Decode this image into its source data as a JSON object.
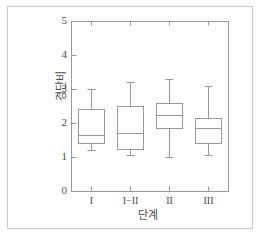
{
  "figure": {
    "background_color": "#ffffff",
    "border_color": "#c9c9c9",
    "line_color": "#999999",
    "text_color": "#4a4a4a"
  },
  "chart_data": {
    "type": "box",
    "title": "",
    "subtitle": "",
    "xlabel": "단계",
    "ylabel": "경단비",
    "categories": [
      "I",
      "I−II",
      "II",
      "III"
    ],
    "xtick_labels": [
      "I",
      "I−II",
      "II",
      "III"
    ],
    "ytick_labels": [
      "0",
      "1",
      "2",
      "3",
      "4",
      "5"
    ],
    "ytick_values": [
      0,
      1,
      2,
      3,
      4,
      5
    ],
    "ylim": [
      0,
      5
    ],
    "grid": false,
    "legend": false,
    "boxes": [
      {
        "category": "I",
        "whisker_low": 1.2,
        "q1": 1.4,
        "median": 1.65,
        "q3": 2.4,
        "whisker_high": 3.0
      },
      {
        "category": "I−II",
        "whisker_low": 1.05,
        "q1": 1.25,
        "median": 1.7,
        "q3": 2.5,
        "whisker_high": 3.2
      },
      {
        "category": "II",
        "whisker_low": 1.0,
        "q1": 1.85,
        "median": 2.25,
        "q3": 2.6,
        "whisker_high": 3.3
      },
      {
        "category": "III",
        "whisker_low": 1.05,
        "q1": 1.4,
        "median": 1.85,
        "q3": 2.15,
        "whisker_high": 3.1
      }
    ]
  }
}
